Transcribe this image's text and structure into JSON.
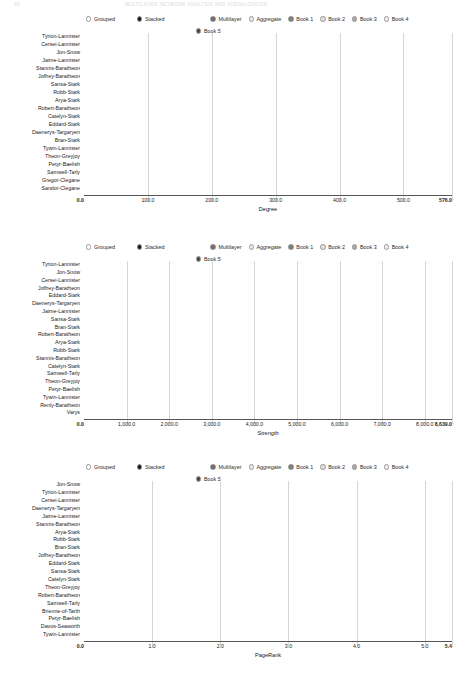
{
  "running_head": {
    "page_number": "60",
    "title": "MULTILAYER NETWORK ANALYSIS AND VISUALIZATION"
  },
  "legend": {
    "mode_options": [
      {
        "label": "Grouped",
        "selected": false,
        "color": "#ffffff"
      },
      {
        "label": "Stacked",
        "selected": true,
        "color": "#1a1a1a"
      }
    ],
    "series": [
      {
        "label": "Multilayer",
        "color": "#6f6f6f"
      },
      {
        "label": "Aggregate",
        "color": "#e8e8e8"
      },
      {
        "label": "Book 1",
        "color": "#7d7d7d"
      },
      {
        "label": "Book 2",
        "color": "#dcdcdc"
      },
      {
        "label": "Book 3",
        "color": "#a9a9a9"
      },
      {
        "label": "Book 4",
        "color": "#efefef"
      },
      {
        "label": "Book 5",
        "color": "#4a4a4a"
      }
    ]
  },
  "chart_data": [
    {
      "type": "bar",
      "orientation": "horizontal",
      "stacked": true,
      "title": "",
      "xlabel": "Degree",
      "ylabel": "",
      "xlim": [
        0.0,
        576.0
      ],
      "xticks": [
        "0.0",
        "100.0",
        "200.0",
        "300.0",
        "400.0",
        "500.0",
        "576.0"
      ],
      "xtick_values": [
        0,
        100,
        200,
        300,
        400,
        500,
        576
      ],
      "grid": true,
      "legend_position": "top",
      "series_names": [
        "Multilayer",
        "Aggregate",
        "Book 1",
        "Book 2",
        "Book 3",
        "Book 4",
        "Book 5"
      ],
      "categories": [
        "Tyrion-Lannister",
        "Cersei-Lannister",
        "Jon-Snow",
        "Jaime-Lannister",
        "Stannis-Baratheon",
        "Joffrey-Baratheon",
        "Sansa-Stark",
        "Robb-Stark",
        "Arya-Stark",
        "Robert-Baratheon",
        "Catelyn-Stark",
        "Eddard-Stark",
        "Daenerys-Targaryen",
        "Bran-Stark",
        "Tywin-Lannister",
        "Theon-Greyjoy",
        "Petyr-Baelish",
        "Samwell-Tarly",
        "Gregor-Clegane",
        "Sandor-Clegane"
      ],
      "series": [
        {
          "name": "Multilayer",
          "values": [
            186,
            166,
            160,
            146,
            130,
            126,
            124,
            122,
            118,
            114,
            112,
            108,
            102,
            100,
            92,
            90,
            86,
            84,
            80,
            78
          ]
        },
        {
          "name": "Aggregate",
          "values": [
            80,
            70,
            74,
            62,
            56,
            50,
            48,
            46,
            50,
            42,
            40,
            38,
            34,
            32,
            30,
            28,
            26,
            24,
            22,
            20
          ]
        },
        {
          "name": "Book 1",
          "values": [
            40,
            44,
            40,
            36,
            30,
            32,
            30,
            26,
            24,
            34,
            30,
            34,
            20,
            18,
            18,
            16,
            20,
            10,
            16,
            14
          ]
        },
        {
          "name": "Book 2",
          "values": [
            58,
            52,
            50,
            46,
            44,
            42,
            40,
            38,
            30,
            30,
            28,
            20,
            24,
            22,
            18,
            18,
            16,
            14,
            12,
            10
          ]
        },
        {
          "name": "Book 3",
          "values": [
            66,
            60,
            58,
            52,
            48,
            40,
            38,
            34,
            32,
            20,
            24,
            14,
            22,
            20,
            20,
            16,
            14,
            16,
            10,
            8
          ]
        },
        {
          "name": "Book 4",
          "values": [
            76,
            56,
            48,
            42,
            32,
            26,
            24,
            22,
            20,
            12,
            16,
            10,
            18,
            16,
            14,
            12,
            10,
            12,
            8,
            6
          ]
        },
        {
          "name": "Book 5",
          "values": [
            70,
            42,
            48,
            28,
            36,
            14,
            12,
            10,
            22,
            6,
            8,
            4,
            20,
            18,
            16,
            14,
            10,
            18,
            6,
            8
          ]
        }
      ]
    },
    {
      "type": "bar",
      "orientation": "horizontal",
      "stacked": true,
      "title": "",
      "xlabel": "Strength",
      "ylabel": "",
      "xlim": [
        0.0,
        8639.0
      ],
      "xticks": [
        "0.0",
        "1,000.0",
        "2,000.0",
        "3,000.0",
        "4,000.0",
        "5,000.0",
        "6,000.0",
        "7,000.0",
        "8,000.0",
        "8,639.0"
      ],
      "xtick_values": [
        0,
        1000,
        2000,
        3000,
        4000,
        5000,
        6000,
        7000,
        8000,
        8639
      ],
      "grid": true,
      "legend_position": "top",
      "series_names": [
        "Multilayer",
        "Aggregate",
        "Book 1",
        "Book 2",
        "Book 3",
        "Book 4",
        "Book 5"
      ],
      "categories": [
        "Tyrion-Lannister",
        "Jon-Snow",
        "Cersei-Lannister",
        "Joffrey-Baratheon",
        "Eddard-Stark",
        "Daenerys-Targaryen",
        "Jaime-Lannister",
        "Sansa-Stark",
        "Bran-Stark",
        "Robert-Baratheon",
        "Arya-Stark",
        "Robb-Stark",
        "Stannis-Baratheon",
        "Catelyn-Stark",
        "Samwell-Tarly",
        "Theon-Greyjoy",
        "Petyr-Baelish",
        "Tywin-Lannister",
        "Renly-Baratheon",
        "Varys"
      ],
      "series": [
        {
          "name": "Multilayer",
          "values": [
            2650,
            2250,
            2150,
            1750,
            1700,
            1600,
            1500,
            1450,
            1400,
            1350,
            1300,
            1250,
            1200,
            1150,
            1050,
            1000,
            950,
            900,
            850,
            800
          ]
        },
        {
          "name": "Aggregate",
          "values": [
            1500,
            1450,
            900,
            820,
            780,
            700,
            680,
            640,
            620,
            580,
            560,
            540,
            520,
            500,
            460,
            440,
            420,
            400,
            380,
            360
          ]
        },
        {
          "name": "Book 1",
          "values": [
            1450,
            900,
            850,
            700,
            1250,
            420,
            700,
            560,
            480,
            820,
            620,
            500,
            300,
            760,
            160,
            280,
            420,
            300,
            320,
            300
          ]
        },
        {
          "name": "Book 2",
          "values": [
            900,
            750,
            700,
            600,
            320,
            560,
            520,
            440,
            400,
            300,
            360,
            380,
            420,
            300,
            260,
            240,
            200,
            180,
            160,
            140
          ]
        },
        {
          "name": "Book 3",
          "values": [
            750,
            700,
            650,
            480,
            140,
            500,
            420,
            340,
            320,
            120,
            280,
            260,
            300,
            140,
            220,
            180,
            160,
            140,
            60,
            120
          ]
        },
        {
          "name": "Book 4",
          "values": [
            640,
            620,
            500,
            300,
            90,
            400,
            260,
            220,
            200,
            60,
            180,
            160,
            200,
            80,
            160,
            120,
            100,
            80,
            40,
            60
          ]
        },
        {
          "name": "Book 5",
          "values": [
            430,
            570,
            380,
            180,
            60,
            340,
            140,
            100,
            160,
            30,
            260,
            80,
            180,
            40,
            200,
            90,
            60,
            60,
            20,
            40
          ]
        }
      ]
    },
    {
      "type": "bar",
      "orientation": "horizontal",
      "stacked": true,
      "title": "",
      "xlabel": "PageRank",
      "ylabel": "",
      "xlim": [
        0.0,
        5.4
      ],
      "xticks": [
        "0.0",
        "1.0",
        "2.0",
        "3.0",
        "4.0",
        "5.0",
        "5.4"
      ],
      "xtick_values": [
        0,
        1,
        2,
        3,
        4,
        5,
        5.4
      ],
      "grid": true,
      "legend_position": "top",
      "series_names": [
        "Multilayer",
        "Aggregate",
        "Book 1",
        "Book 2",
        "Book 3",
        "Book 4",
        "Book 5"
      ],
      "categories": [
        "Jon-Snow",
        "Tyrion-Lannister",
        "Cersei-Lannister",
        "Daenerys-Targaryen",
        "Jaime-Lannister",
        "Stannis-Baratheon",
        "Arya-Stark",
        "Robb-Stark",
        "Bran-Stark",
        "Joffrey-Baratheon",
        "Eddard-Stark",
        "Sansa-Stark",
        "Catelyn-Stark",
        "Theon-Greyjoy",
        "Robert-Baratheon",
        "Samwell-Tarly",
        "Brienne-of-Tarth",
        "Petyr-Baelish",
        "Davos-Seaworth",
        "Tywin-Lannister"
      ],
      "series": [
        {
          "name": "Multilayer",
          "values": [
            1.3,
            1.22,
            0.88,
            0.8,
            0.78,
            0.76,
            0.74,
            0.72,
            0.7,
            0.66,
            0.64,
            0.62,
            0.6,
            0.58,
            0.56,
            0.52,
            0.46,
            0.44,
            0.42,
            0.4
          ]
        },
        {
          "name": "Aggregate",
          "values": [
            0.72,
            0.66,
            0.62,
            0.6,
            0.56,
            0.5,
            0.46,
            0.44,
            0.42,
            0.4,
            0.38,
            0.36,
            0.34,
            0.32,
            0.3,
            0.28,
            0.24,
            0.22,
            0.2,
            0.18
          ]
        },
        {
          "name": "Book 1",
          "values": [
            0.78,
            0.7,
            0.72,
            0.5,
            0.6,
            0.24,
            0.62,
            0.58,
            0.56,
            0.44,
            0.64,
            0.5,
            0.54,
            0.24,
            0.5,
            0.12,
            0.04,
            0.34,
            0.04,
            0.22
          ]
        },
        {
          "name": "Book 2",
          "values": [
            0.86,
            0.76,
            0.7,
            0.62,
            0.58,
            0.52,
            0.44,
            0.42,
            0.4,
            0.38,
            0.14,
            0.36,
            0.34,
            0.36,
            0.2,
            0.26,
            0.18,
            0.2,
            0.14,
            0.14
          ]
        },
        {
          "name": "Book 3",
          "values": [
            0.8,
            0.74,
            0.64,
            0.58,
            0.52,
            0.48,
            0.4,
            0.36,
            0.34,
            0.3,
            0.06,
            0.28,
            0.26,
            0.3,
            0.1,
            0.24,
            0.16,
            0.14,
            0.12,
            0.1
          ]
        },
        {
          "name": "Book 4",
          "values": [
            0.56,
            0.58,
            0.52,
            0.46,
            0.42,
            0.38,
            0.32,
            0.28,
            0.26,
            0.22,
            0.04,
            0.22,
            0.2,
            0.24,
            0.06,
            0.2,
            0.14,
            0.1,
            0.1,
            0.08
          ]
        },
        {
          "name": "Book 5",
          "values": [
            0.48,
            0.42,
            0.34,
            0.42,
            0.2,
            0.44,
            0.3,
            0.12,
            0.22,
            0.08,
            0.02,
            0.12,
            0.1,
            0.32,
            0.04,
            0.28,
            0.26,
            0.06,
            0.2,
            0.04
          ]
        }
      ]
    }
  ]
}
